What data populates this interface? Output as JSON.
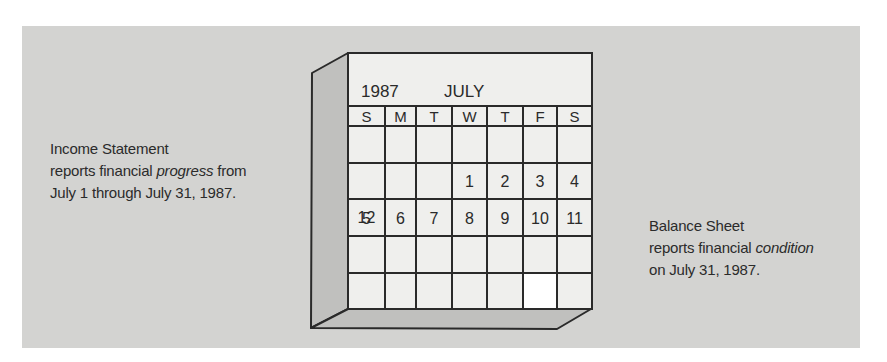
{
  "colors": {
    "background_panel": "#d3d3d1",
    "calendar_face": "#efefed",
    "calendar_side": "#c0c0be",
    "highlight_cell": "#ffffff",
    "line": "#2a2a2a",
    "arrow": "#6e6e6e"
  },
  "calendar": {
    "year": "1987",
    "month": "JULY",
    "weekdays": [
      "S",
      "M",
      "T",
      "W",
      "T",
      "F",
      "S"
    ],
    "weeks": [
      [
        "",
        "",
        "",
        "1",
        "2",
        "3",
        "4"
      ],
      [
        "5",
        "6",
        "7",
        "8",
        "9",
        "10",
        "11"
      ],
      [
        "12",
        "13",
        "14",
        "15",
        "16",
        "17",
        "18"
      ],
      [
        "19",
        "20",
        "21",
        "22",
        "23",
        "24",
        "25"
      ],
      [
        "26",
        "27",
        "28",
        "29",
        "30",
        "31",
        ""
      ]
    ],
    "highlighted_date": "31"
  },
  "income_statement": {
    "title": "Income Statement",
    "line2_prefix": "reports financial ",
    "line2_emphasis": "progress",
    "line2_suffix": " from",
    "line3": "July 1 through July 31, 1987."
  },
  "balance_sheet": {
    "title": "Balance Sheet",
    "line2_prefix": "reports financial ",
    "line2_emphasis": "condition",
    "line3": "on July 31, 1987."
  },
  "icons": {
    "left_arrow": "arrow-right-icon",
    "right_arrow": "arrow-left-icon",
    "bracket": "period-bracket"
  }
}
